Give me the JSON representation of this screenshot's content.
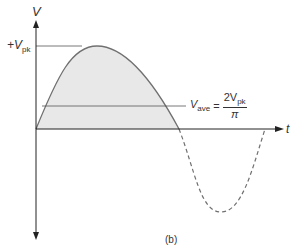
{
  "figure": {
    "caption": "(b)",
    "y_axis_label": "V",
    "x_axis_label": "t",
    "peak_label": {
      "prefix": "+V",
      "sub": "pk"
    },
    "average_label": {
      "lhs": "V",
      "lhs_sub": "ave",
      "eq": "=",
      "num": "2V",
      "num_sub": "pk",
      "den": "π"
    }
  },
  "colors": {
    "fill": "#e8e8e8",
    "curve": "#707070",
    "axis": "#222222"
  }
}
